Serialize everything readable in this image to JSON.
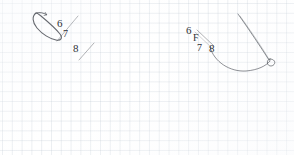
{
  "page": {
    "background_color": "#ffffff",
    "grid_color": "#bac4d0",
    "grid_spacing_px": 10,
    "ink_color": "#4a4e55",
    "label_color": "#2e3136",
    "width": 294,
    "height": 155
  },
  "figures": [
    {
      "id": "figure-left",
      "name": "left-sketch",
      "description": "elongated narrow loop drawn diagonally up-left with two short parallel diagonal strokes below it",
      "labels": [
        {
          "text": "6",
          "x": 58,
          "y": 22
        },
        {
          "text": "7",
          "x": 64,
          "y": 33
        },
        {
          "text": "8",
          "x": 74,
          "y": 48
        }
      ],
      "strokes": [
        {
          "name": "loop-outline",
          "type": "closed-loop"
        },
        {
          "name": "stroke-upper-diagonal",
          "type": "line"
        },
        {
          "name": "stroke-lower-diagonal",
          "type": "line"
        }
      ]
    },
    {
      "id": "figure-right",
      "name": "right-sketch",
      "description": "long diagonal line descending to a small loop at lower right, joined by a sweeping concave arc and a short angled stroke at upper left",
      "labels": [
        {
          "text": "6",
          "x": 188,
          "y": 29
        },
        {
          "text": "F",
          "x": 194,
          "y": 37
        },
        {
          "text": "7",
          "x": 198,
          "y": 48
        },
        {
          "text": "8",
          "x": 210,
          "y": 48
        }
      ],
      "strokes": [
        {
          "name": "stroke-long-diagonal",
          "type": "line"
        },
        {
          "name": "stroke-arc",
          "type": "arc"
        },
        {
          "name": "stroke-small-loop",
          "type": "closed-loop"
        },
        {
          "name": "stroke-short-angled",
          "type": "line"
        }
      ]
    }
  ]
}
